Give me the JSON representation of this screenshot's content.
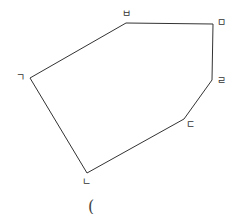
{
  "diagram": {
    "type": "polygon",
    "shape": "hexagon",
    "stroke_color": "#333333",
    "vertices": [
      {
        "label": "ㄱ",
        "x": 30,
        "y": 78,
        "label_x": 20,
        "label_y": 81
      },
      {
        "label": "ㄴ",
        "x": 87,
        "y": 173,
        "label_x": 86,
        "label_y": 185
      },
      {
        "label": "ㄷ",
        "x": 184,
        "y": 119,
        "label_x": 190,
        "label_y": 128
      },
      {
        "label": "ㄹ",
        "x": 212,
        "y": 80,
        "label_x": 221,
        "label_y": 84
      },
      {
        "label": "ㅁ",
        "x": 213,
        "y": 24,
        "label_x": 221,
        "label_y": 26
      },
      {
        "label": "ㅂ",
        "x": 126,
        "y": 23,
        "label_x": 126,
        "label_y": 17
      }
    ],
    "caption": "("
  }
}
